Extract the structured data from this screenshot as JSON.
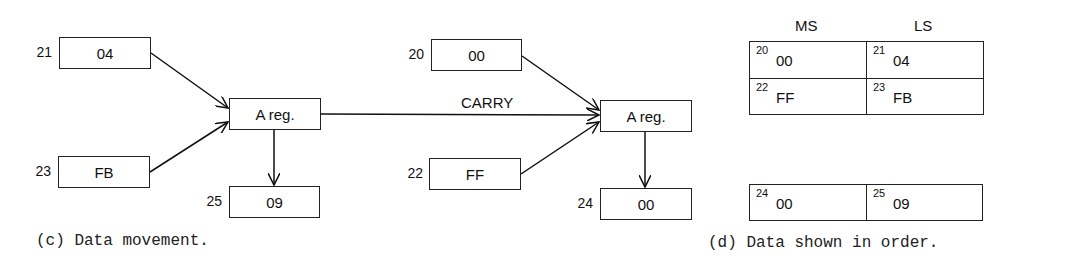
{
  "movement": {
    "caption": "(c) Data movement.",
    "carry_label": "CARRY",
    "stage1": {
      "inputs": [
        {
          "address": "21",
          "value": "04"
        },
        {
          "address": "23",
          "value": "FB"
        }
      ],
      "register": "A reg.",
      "output": {
        "address": "25",
        "value": "09"
      }
    },
    "stage2": {
      "inputs": [
        {
          "address": "20",
          "value": "00"
        },
        {
          "address": "22",
          "value": "FF"
        }
      ],
      "register": "A reg.",
      "output": {
        "address": "24",
        "value": "00"
      }
    }
  },
  "ordered": {
    "caption": "(d) Data shown in order.",
    "headers": {
      "ms": "MS",
      "ls": "LS"
    },
    "operands": [
      [
        {
          "address": "20",
          "value": "00"
        },
        {
          "address": "21",
          "value": "04"
        }
      ],
      [
        {
          "address": "22",
          "value": "FF"
        },
        {
          "address": "23",
          "value": "FB"
        }
      ]
    ],
    "result": [
      {
        "address": "24",
        "value": "00"
      },
      {
        "address": "25",
        "value": "09"
      }
    ]
  }
}
